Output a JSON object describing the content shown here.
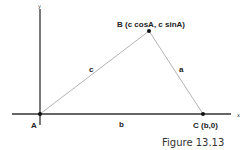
{
  "figure": {
    "caption": "Figure 13.13",
    "axes": {
      "x_label": "x",
      "y_label": "y"
    },
    "points": {
      "A": {
        "label": "A"
      },
      "B": {
        "label": "B (c cosA, c sinA)"
      },
      "C": {
        "label": "C (b,0)"
      }
    },
    "sides": {
      "a": "a",
      "b": "b",
      "c": "c"
    },
    "colors": {
      "axis": "#222222",
      "side": "#aaaaaa",
      "point": "#111111"
    }
  }
}
